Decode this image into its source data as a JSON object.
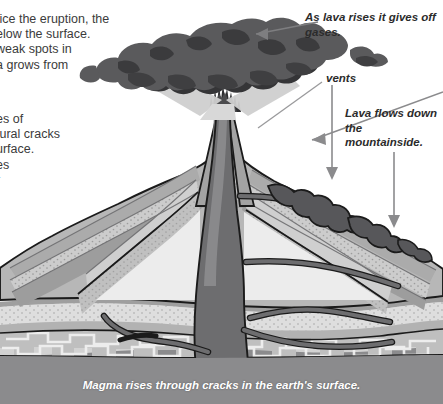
{
  "page": {
    "width": 443,
    "height": 404,
    "background_color": "#ffffff"
  },
  "left_text": {
    "block_a_lines": [
      "tice the eruption, the",
      "elow the surface.",
      "weak spots in",
      "a grows from"
    ],
    "block_b_lines": [
      "es of",
      "tural cracks",
      "urface.",
      "es",
      "r"
    ],
    "block_a": "tice the eruption, the\nelow the surface.\nweak spots in\na grows from",
    "block_b": "es of\ntural cracks\nurface.\nes\nr",
    "note": "Body text is clipped at the left edge of the screenshot."
  },
  "callouts": {
    "gases": "As lava rises it gives off gases.",
    "vents": "vents",
    "lava_flows": "Lava flows down the mountainside."
  },
  "caption": {
    "bottom": "Magma rises through cracks in the earth's surface."
  },
  "colors": {
    "ash_cloud_dark": "#58585a",
    "ash_cloud_shadow": "#39393b",
    "ash_plume_light": "#c9c9c9",
    "magma_conduit": "#6e6e70",
    "magma_conduit_light": "#8a8a8c",
    "mountain_light": "#b9b9b9",
    "mountain_mid": "#a2a2a2",
    "mountain_dark": "#8d8d8d",
    "strata_pale": "#d9d9d9",
    "strata_white": "#eeeeee",
    "ground_deep": "#8f8f8f",
    "ground_deepest": "#7e7e80",
    "crust_band": "#cfcfcf",
    "lava_flow": "#5f5f61",
    "outline": "#1b1b1b",
    "arrow": "#8b8b8d",
    "text": "#3b3b3b",
    "caption_text": "#ffffff"
  },
  "annotations": {
    "arrow_gases": {
      "from_x": 318,
      "from_y": 22,
      "to_x": 248,
      "to_y": 35,
      "icon": "arrow-left-icon"
    },
    "arrow_vents": {
      "from_x": 332,
      "from_y": 84,
      "to_x": 332,
      "to_y": 178,
      "icon": "arrow-down-icon"
    },
    "arrow_lava_flows": {
      "from_x": 394,
      "from_y": 152,
      "to_x": 394,
      "to_y": 226,
      "icon": "arrow-down-icon"
    },
    "leader_vents": {
      "from_x": 322,
      "from_y": 80,
      "to_x": 258,
      "to_y": 128,
      "icon": "leader-line-icon"
    },
    "leader_gases_cloud": {
      "icon": "arrow-left-icon"
    }
  },
  "diagram": {
    "type": "cross-section-illustration",
    "parts": [
      "ash cloud",
      "ash plume",
      "crater with erupting lava",
      "volcanic cone with rock strata",
      "central magma conduit",
      "side vents",
      "lava flows on mountainside",
      "earth crust layers",
      "magma chamber"
    ]
  }
}
